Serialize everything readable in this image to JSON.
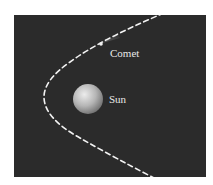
{
  "diagram": {
    "labels": {
      "comet": "Comet",
      "sun": "Sun"
    },
    "colors": {
      "background": "#2b2b2b",
      "orbit": "#f2f2f2",
      "sun_highlight": "#e6e6e6",
      "sun_shadow": "#7a7a7a",
      "label": "#e8e8e8"
    },
    "orbit_style": "dashed parabola"
  }
}
